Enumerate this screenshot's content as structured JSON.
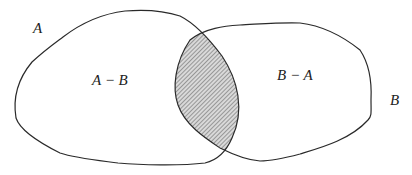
{
  "diagram": {
    "type": "venn",
    "sets": [
      {
        "id": "A",
        "label": "A"
      },
      {
        "id": "B",
        "label": "B"
      }
    ],
    "regions": {
      "a_minus_b": {
        "label": "A − B"
      },
      "b_minus_a": {
        "label": "B − A"
      },
      "intersection": {
        "label": "",
        "fill": "hatched"
      }
    },
    "colors": {
      "stroke": "#2a2a2a",
      "hatch": "#555555",
      "background": "#ffffff"
    }
  }
}
